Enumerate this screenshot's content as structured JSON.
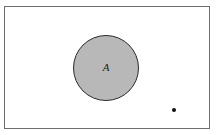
{
  "diagram": {
    "type": "venn",
    "universal_set": {
      "shape": "rectangle",
      "border_color": "#6e6e6e"
    },
    "sets": [
      {
        "label": "A",
        "shape": "circle",
        "fill_color": "#b8b8b8",
        "border_color": "#2a2a2a",
        "shaded": true
      }
    ],
    "points": [
      {
        "label": "",
        "location": "outside A, lower right of universal set"
      }
    ]
  }
}
